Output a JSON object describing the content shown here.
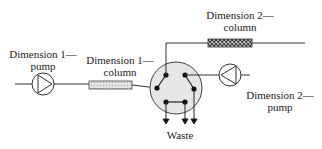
{
  "diagram": {
    "type": "two-dimensional liquid chromatography schematic",
    "labels": {
      "dim1_pump": [
        "Dimension 1—",
        "pump"
      ],
      "dim1_column": [
        "Dimension 1—",
        "column"
      ],
      "dim2_column": [
        "Dimension 2—",
        "column"
      ],
      "dim2_pump": [
        "Dimension 2—",
        "pump"
      ],
      "waste": "Waste"
    },
    "components": [
      {
        "id": "dim1-pump",
        "kind": "pump"
      },
      {
        "id": "dim1-column",
        "kind": "column",
        "fill": "light-dotted"
      },
      {
        "id": "switching-valve",
        "kind": "6-port valve",
        "ports": 6
      },
      {
        "id": "dim2-column",
        "kind": "column",
        "fill": "dark-crosshatch"
      },
      {
        "id": "dim2-pump",
        "kind": "pump"
      }
    ],
    "waste_outlets": 3,
    "colors": {
      "line": "#333333",
      "valve_fill": "#e6e6e6",
      "column1_fill": "#d8d8d8",
      "column2_fill": "#555555"
    }
  }
}
